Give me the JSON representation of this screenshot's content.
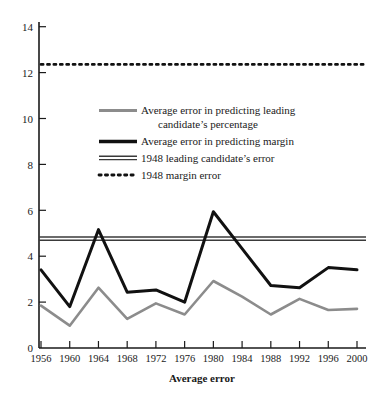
{
  "chart_data": {
    "type": "line",
    "title": "",
    "subtitle": "",
    "xlabel": "Average error",
    "ylabel": "",
    "categories": [
      "1956",
      "1960",
      "1964",
      "1968",
      "1972",
      "1976",
      "1980",
      "1984",
      "1988",
      "1992",
      "1996",
      "2000"
    ],
    "x_tick_labels": [
      "1956",
      "1960",
      "1964",
      "1968",
      "1972",
      "1976",
      "1980",
      "1984",
      "1988",
      "1992",
      "1996",
      "2000"
    ],
    "y_tick_labels": [
      "0",
      "2",
      "4",
      "6",
      "8",
      "10",
      "12",
      "14"
    ],
    "y_ticks": [
      0,
      2,
      4,
      6,
      8,
      10,
      12,
      14
    ],
    "ylim": [
      0,
      14.6
    ],
    "grid": false,
    "legend_position": "upper-center",
    "series": [
      {
        "name": "Average error in predicting leading candidate's percentage",
        "style": "solid",
        "color": "#8c8c8c",
        "width": 2.6,
        "values": [
          1.9,
          1.0,
          2.7,
          1.3,
          2.0,
          1.5,
          3.0,
          2.3,
          1.5,
          2.2,
          1.7,
          1.75
        ]
      },
      {
        "name": "Average error in predicting margin",
        "style": "solid",
        "color": "#111111",
        "width": 3.0,
        "values": [
          3.5,
          1.85,
          5.3,
          2.5,
          2.6,
          2.05,
          6.1,
          4.45,
          2.8,
          2.7,
          3.6,
          3.5
        ]
      }
    ],
    "reference_lines": [
      {
        "name": "1948 leading candidate's error",
        "style": "double-solid",
        "color": "#3a3a3a",
        "value": 4.9
      },
      {
        "name": "1948 margin error",
        "style": "dotted",
        "color": "#111111",
        "value": 12.7
      }
    ],
    "legend_entries": [
      {
        "label_line1": "Average error in predicting leading",
        "label_line2": "candidate’s percentage",
        "swatch": "thick-gray-solid"
      },
      {
        "label_line1": "Average error in predicting margin",
        "label_line2": "",
        "swatch": "thick-black-solid"
      },
      {
        "label_line1": "1948 leading candidate’s error",
        "label_line2": "",
        "swatch": "double-black-solid"
      },
      {
        "label_line1": "1948 margin error",
        "label_line2": "",
        "swatch": "black-dotted"
      }
    ]
  },
  "axis": {
    "x_title": "Average error",
    "y_labels": [
      "14",
      "12",
      "10",
      "8",
      "6",
      "4",
      "2",
      "0"
    ],
    "x_labels": [
      "1956",
      "1960",
      "1964",
      "1968",
      "1972",
      "1976",
      "1980",
      "1984",
      "1988",
      "1992",
      "1996",
      "2000"
    ]
  },
  "legend": {
    "entry_1_line_1": "Average error in predicting leading",
    "entry_1_line_2": "candidate’s percentage",
    "entry_2": "Average error in predicting margin",
    "entry_3": "1948 leading candidate’s error",
    "entry_4": "1948 margin error"
  },
  "colors": {
    "series_gray": "#8c8c8c",
    "series_black": "#111111",
    "axis": "#1a1a1a",
    "background": "#ffffff"
  }
}
